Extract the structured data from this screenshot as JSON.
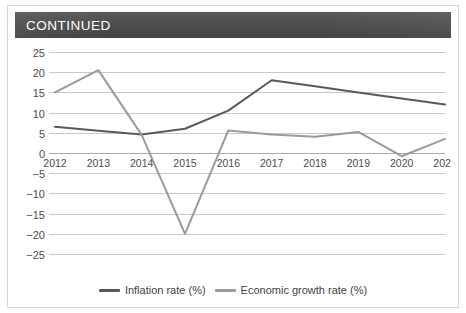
{
  "header": {
    "title": "CONTINUED"
  },
  "legend": {
    "items": [
      {
        "label": "Inflation rate (%)",
        "color": "#595959",
        "icon": "line-swatch-icon"
      },
      {
        "label": "Economic growth rate (%)",
        "color": "#9a9a9a",
        "icon": "line-swatch-icon"
      }
    ]
  },
  "chart_data": {
    "type": "line",
    "title": "CONTINUED",
    "xlabel": "",
    "ylabel": "",
    "categories": [
      "2012",
      "2013",
      "2014",
      "2015",
      "2016",
      "2017",
      "2018",
      "2019",
      "2020",
      "2021"
    ],
    "x": [
      2012,
      2013,
      2014,
      2015,
      2016,
      2017,
      2018,
      2019,
      2020,
      2021
    ],
    "ylim": [
      -25,
      25
    ],
    "yticks": [
      25,
      20,
      15,
      10,
      5,
      0,
      -5,
      -10,
      -15,
      -20,
      -25
    ],
    "ytick_labels": [
      "25",
      "20",
      "15",
      "10",
      "5",
      "0",
      "−5",
      "−10",
      "−15",
      "−20",
      "−25"
    ],
    "grid": true,
    "legend_position": "bottom",
    "series": [
      {
        "name": "Inflation rate (%)",
        "color": "#595959",
        "values": [
          6.5,
          5.5,
          4.6,
          6.0,
          10.5,
          18.0,
          16.5,
          15.0,
          13.5,
          12.0
        ]
      },
      {
        "name": "Economic growth rate (%)",
        "color": "#9a9a9a",
        "values": [
          15.0,
          20.5,
          4.5,
          -20.0,
          5.6,
          4.6,
          4.0,
          5.2,
          -0.8,
          3.5
        ]
      }
    ]
  }
}
